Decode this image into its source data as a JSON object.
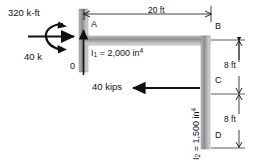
{
  "figure": {
    "title_text": "",
    "type": "structural-frame-diagram",
    "colors": {
      "member_fill_dark": "#6f6f6f",
      "member_fill_light": "#d9d9d9",
      "line": "#1a1a1a",
      "background": "#ffffff"
    }
  },
  "loads": {
    "moment": {
      "label": "320 k-ft",
      "icon": "curved-moment-arrow"
    },
    "horizontal_force_top": {
      "label": "40 k",
      "icon": "right-arrow"
    },
    "horizontal_force_lower": {
      "label": "40 kips",
      "icon": "left-arrow"
    },
    "support_reaction": {
      "label": "0",
      "icon": "up-arrow"
    }
  },
  "joints": {
    "a": "A",
    "b": "B",
    "c": "C",
    "d": "D",
    "origin": "0"
  },
  "members": {
    "beam": {
      "inertia_symbol": "I",
      "inertia_index": "1",
      "equals": " = ",
      "inertia_value": "2,000 in",
      "inertia_exp": "4",
      "full_label": "I1 = 2,000 in4"
    },
    "column_right": {
      "inertia_symbol": "I",
      "inertia_index": "2",
      "equals": " = ",
      "inertia_value": "1,500 in",
      "inertia_exp": "4",
      "full_label": "I2 = 1,500 in4"
    }
  },
  "dimensions": {
    "span_top": "20 ft",
    "height_upper": "8 ft",
    "height_lower": "8 ft"
  }
}
